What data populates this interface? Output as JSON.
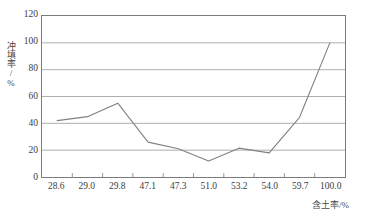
{
  "chart_data": {
    "type": "line",
    "title": "",
    "subtitle": "",
    "xlabel": "含土率/%",
    "ylabel": "冲填率/%",
    "categories": [
      "28.6",
      "29.0",
      "29.8",
      "47.1",
      "47.3",
      "51.0",
      "53.2",
      "54.0",
      "59.7",
      "100.0"
    ],
    "values": [
      42,
      45,
      55,
      26,
      21,
      12,
      21.5,
      18,
      44.5,
      100
    ],
    "series": [
      {
        "name": "冲填率",
        "values": [
          42,
          45,
          55,
          26,
          21,
          12,
          21.5,
          18,
          44.5,
          100
        ]
      }
    ],
    "ylim": [
      0,
      120
    ],
    "yticks": [
      0,
      20,
      40,
      60,
      80,
      100,
      120
    ],
    "ytick_labels": [
      "0",
      "20",
      "40",
      "60",
      "80",
      "100",
      "120"
    ],
    "xtick_labels": [
      "28.6",
      "29.0",
      "29.8",
      "47.1",
      "47.3",
      "51.0",
      "53.2",
      "54.0",
      "59.7",
      "100.0"
    ],
    "grid": "horizontal",
    "legend": "none",
    "colors": {
      "line": "#808080",
      "grid": "#9a9a9a",
      "axis": "#7b7b7b",
      "text": "#3d3d3d",
      "background": "#ffffff"
    },
    "annotations": []
  }
}
